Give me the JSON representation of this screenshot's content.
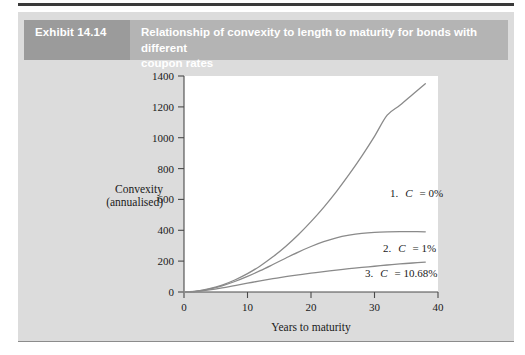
{
  "figure": {
    "exhibit_number": "Exhibit 14.14",
    "title_line1": "Relationship of convexity to length to maturity for bonds with different",
    "title_line2": "coupon rates",
    "badge_color": "#9b9b9b",
    "band_color": "#b4b4b4",
    "panel_color": "#dcdcdc"
  },
  "chart_data": {
    "type": "line",
    "title": "Relationship of convexity to length to maturity for bonds with different coupon rates",
    "xlabel": "Years to maturity",
    "ylabel": "Convexity (annualised)",
    "ylabel_line1": "Convexity",
    "ylabel_line2": "(annualised)",
    "xlim": [
      0,
      40
    ],
    "ylim": [
      0,
      1400
    ],
    "xticks": [
      0,
      10,
      20,
      30,
      40
    ],
    "yticks": [
      0,
      200,
      400,
      600,
      800,
      1000,
      1200,
      1400
    ],
    "xtick_labels": [
      "0",
      "10",
      "20",
      "30",
      "40"
    ],
    "ytick_labels": [
      "0",
      "200",
      "400",
      "600",
      "800",
      "1000",
      "1200",
      "1400"
    ],
    "grid": false,
    "legend_position": "inline-annotations",
    "line_color": "#8a8a8a",
    "series": [
      {
        "name": "1. C = 0%",
        "label_prefix": "1.",
        "label_symbol": "C",
        "label_value": "= 0%",
        "coupon_rate": "0%",
        "label_x": 32.5,
        "label_y": 790,
        "x": [
          0,
          2,
          4,
          6,
          8,
          10,
          12,
          14,
          16,
          18,
          20,
          22,
          24,
          26,
          28,
          30,
          32,
          34,
          36,
          38
        ],
        "values": [
          0,
          6,
          22,
          45,
          78,
          119,
          169,
          228,
          295,
          371,
          456,
          549,
          651,
          762,
          881,
          1009,
          1146,
          1210,
          1280,
          1350
        ]
      },
      {
        "name": "2. C = 1%",
        "label_prefix": "2.",
        "label_symbol": "C",
        "label_value": "= 1%",
        "coupon_rate": "1%",
        "label_x": 31.0,
        "label_y": 430,
        "x": [
          0,
          2,
          4,
          6,
          8,
          10,
          12,
          14,
          16,
          18,
          20,
          22,
          24,
          26,
          28,
          30,
          32,
          34,
          36,
          38
        ],
        "values": [
          0,
          5,
          19,
          40,
          68,
          101,
          138,
          178,
          219,
          259,
          295,
          326,
          351,
          368,
          380,
          387,
          390,
          391,
          391,
          390
        ]
      },
      {
        "name": "3. C = 10.68%",
        "label_prefix": "3.",
        "label_symbol": "C",
        "label_value": "= 10.68%",
        "coupon_rate": "10.68%",
        "label_x": 28.5,
        "label_y": 255,
        "x": [
          0,
          2,
          4,
          6,
          8,
          10,
          12,
          14,
          16,
          18,
          20,
          22,
          24,
          26,
          28,
          30,
          32,
          34,
          36,
          38
        ],
        "values": [
          0,
          4,
          14,
          27,
          42,
          57,
          72,
          86,
          99,
          111,
          122,
          132,
          142,
          151,
          159,
          167,
          175,
          182,
          188,
          194
        ]
      }
    ]
  }
}
